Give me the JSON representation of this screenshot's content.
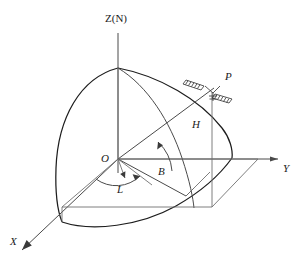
{
  "figure": {
    "title": "",
    "caption": "",
    "axes": {
      "z": "Z(N)",
      "x": "X",
      "y": "Y"
    },
    "points": {
      "origin": "O",
      "target": "P"
    },
    "quantities": {
      "height": "H",
      "latitude": "B",
      "longitude": "L"
    },
    "colors": {
      "line": "#4a4a4a",
      "line_dark": "#1d1d1d",
      "line_thin": "#707070",
      "label": "#1a1a1a",
      "background": "#ffffff"
    }
  }
}
